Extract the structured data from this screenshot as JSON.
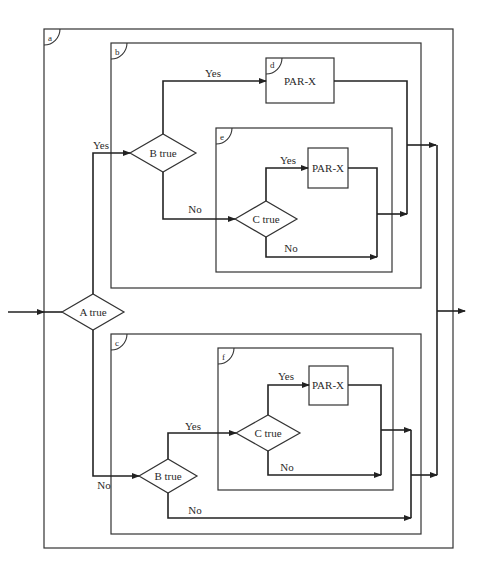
{
  "diagram": {
    "type": "nested-structured-flowchart",
    "blocks": {
      "a": {
        "tag": "a"
      },
      "b": {
        "tag": "b"
      },
      "c": {
        "tag": "c"
      },
      "d": {
        "tag": "d",
        "label": "PAR-X"
      },
      "e": {
        "tag": "e"
      },
      "f": {
        "tag": "f"
      }
    },
    "decisions": {
      "a_true": "A true",
      "b_true_upper": "B true",
      "c_true_upper": "C true",
      "c_true_lower": "C true",
      "b_true_lower": "B true"
    },
    "processes": {
      "par_x_d": "PAR-X",
      "par_x_e": "PAR-X",
      "par_x_f": "PAR-X"
    },
    "edge_labels": {
      "a_yes": "Yes",
      "a_no": "No",
      "b_upper_yes": "Yes",
      "b_upper_no": "No",
      "c_upper_yes": "Yes",
      "c_upper_no": "No",
      "b_lower_yes": "Yes",
      "b_lower_no": "No",
      "c_lower_yes": "Yes",
      "c_lower_no": "No"
    }
  }
}
